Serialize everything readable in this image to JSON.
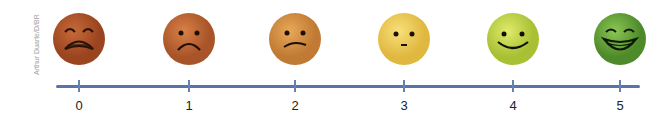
{
  "credit": "Arthur Duarte/D/BR",
  "scale": {
    "title": "",
    "points": [
      {
        "value": "0",
        "expression": "crying",
        "color": "#b5572a",
        "x": 79
      },
      {
        "value": "1",
        "expression": "sad",
        "color": "#c26a36",
        "x": 189
      },
      {
        "value": "2",
        "expression": "slightly-frowning",
        "color": "#d68e45",
        "x": 295
      },
      {
        "value": "3",
        "expression": "neutral",
        "color": "#f0cc55",
        "x": 404
      },
      {
        "value": "4",
        "expression": "smiling",
        "color": "#c8d94a",
        "x": 513
      },
      {
        "value": "5",
        "expression": "grinning",
        "color": "#6fae3c",
        "x": 620
      }
    ]
  },
  "axis_color": "#5a72aa"
}
